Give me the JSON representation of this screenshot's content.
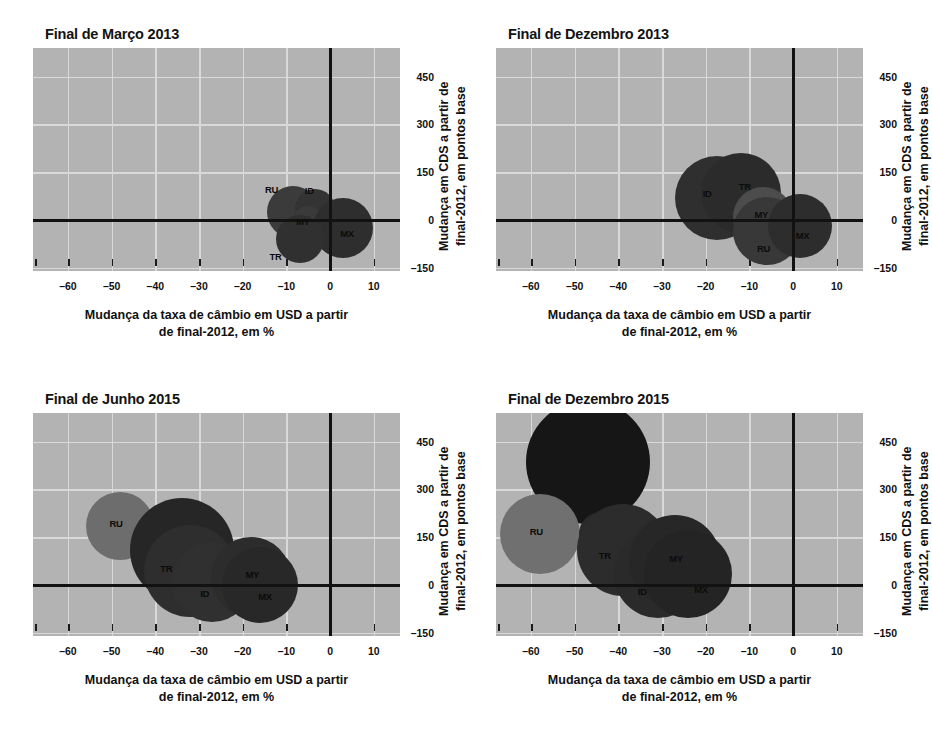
{
  "figure": {
    "panel_count": 4,
    "background_color": "#ffffff",
    "plot_background_color": "#b3b3b3",
    "gridline_color": "#d9d9d9",
    "axis_color": "#121212"
  },
  "axis": {
    "xlabel_line1": "Mudança da taxa de câmbio em USD a partir",
    "xlabel_line2": "de final-2012, em %",
    "ylabel_line1": "Mudança em CDS a partir de",
    "ylabel_line2": "final-2012, em pontos base",
    "xticks": [
      "–60",
      "–50",
      "–40",
      "–30",
      "–20",
      "–10",
      "0",
      "10"
    ],
    "xtick_values": [
      -60,
      -50,
      -40,
      -30,
      -20,
      -10,
      0,
      10
    ],
    "yticks": [
      "450",
      "300",
      "150",
      "0",
      "–150"
    ],
    "ytick_values": [
      450,
      300,
      150,
      0,
      -150
    ],
    "xlim": [
      -68,
      16
    ],
    "ylim": [
      -160,
      540
    ]
  },
  "chart_data": [
    {
      "type": "scatter",
      "title": "Final de Março 2013",
      "xlabel": "Mudança da taxa de câmbio em USD a partir de final-2012, em %",
      "ylabel": "Mudança em CDS a partir de final-2012, em pontos base",
      "xlim": [
        -68,
        16
      ],
      "ylim": [
        -160,
        540
      ],
      "grid": true,
      "points": [
        {
          "label": "RU",
          "x": -8.5,
          "y": 25,
          "size": 26,
          "color": "#3b3b3b",
          "label_dx": -20,
          "label_dy": -22
        },
        {
          "label": "ID",
          "x": -3.5,
          "y": 35,
          "size": 20,
          "color": "#333333",
          "label_dx": -2,
          "label_dy": -18
        },
        {
          "label": "MY",
          "x": -5.0,
          "y": -5,
          "size": 16,
          "color": "#3a3a3a",
          "label_dx": -4,
          "label_dy": 0
        },
        {
          "label": "MX",
          "x": 3.0,
          "y": -25,
          "size": 30,
          "color": "#2e2e2e",
          "label_dx": 5,
          "label_dy": 6
        },
        {
          "label": "TR",
          "x": -7.0,
          "y": -60,
          "size": 24,
          "color": "#303030",
          "label_dx": -22,
          "label_dy": 18
        }
      ]
    },
    {
      "type": "scatter",
      "title": "Final de Dezembro 2013",
      "xlabel": "Mudança da taxa de câmbio em USD a partir de final-2012, em %",
      "ylabel": "Mudança em CDS a partir de final-2012, em pontos base",
      "xlim": [
        -68,
        16
      ],
      "ylim": [
        -160,
        540
      ],
      "grid": true,
      "points": [
        {
          "label": "ID",
          "x": -17.5,
          "y": 70,
          "size": 42,
          "color": "#2f2f2f",
          "label_dx": -6,
          "label_dy": -4
        },
        {
          "label": "TR",
          "x": -12.0,
          "y": 85,
          "size": 40,
          "color": "#2b2b2b",
          "label_dx": 6,
          "label_dy": -6
        },
        {
          "label": "MY",
          "x": -7.0,
          "y": 10,
          "size": 30,
          "color": "#4c4c4c",
          "label_dx": 0,
          "label_dy": -2
        },
        {
          "label": "RU",
          "x": -6.0,
          "y": -35,
          "size": 34,
          "color": "#383838",
          "label_dx": -2,
          "label_dy": 18
        },
        {
          "label": "MX",
          "x": 1.5,
          "y": -20,
          "size": 32,
          "color": "#2d2d2d",
          "label_dx": 4,
          "label_dy": 10
        }
      ]
    },
    {
      "type": "scatter",
      "title": "Final de Junho 2015",
      "xlabel": "Mudança da taxa de câmbio em USD a partir de final-2012, em %",
      "ylabel": "Mudança em CDS a partir de final-2012, em pontos base",
      "xlim": [
        -68,
        16
      ],
      "ylim": [
        -160,
        540
      ],
      "grid": true,
      "points": [
        {
          "label": "RU",
          "x": -48.0,
          "y": 185,
          "size": 34,
          "color": "#6d6d6d",
          "label_dx": -3,
          "label_dy": -2
        },
        {
          "label": "",
          "x": -34.0,
          "y": 110,
          "size": 52,
          "color": "#262626",
          "label_dx": 0,
          "label_dy": 0
        },
        {
          "label": "TR",
          "x": -32.0,
          "y": 45,
          "size": 46,
          "color": "#2e2e2e",
          "label_dx": -22,
          "label_dy": -2
        },
        {
          "label": "ID",
          "x": -27.0,
          "y": 10,
          "size": 40,
          "color": "#303030",
          "label_dx": -4,
          "label_dy": 12
        },
        {
          "label": "MY",
          "x": -18.0,
          "y": 25,
          "size": 40,
          "color": "#2c2c2c",
          "label_dx": 2,
          "label_dy": -2
        },
        {
          "label": "MX",
          "x": -16.0,
          "y": 0,
          "size": 38,
          "color": "#282828",
          "label_dx": 6,
          "label_dy": 12
        }
      ]
    },
    {
      "type": "scatter",
      "title": "Final de Dezembro 2015",
      "xlabel": "Mudança da taxa de câmbio em USD a partir de final-2012, em %",
      "ylabel": "Mudança em CDS a partir de final-2012, em pontos base",
      "xlim": [
        -68,
        16
      ],
      "ylim": [
        -160,
        540
      ],
      "grid": true,
      "points": [
        {
          "label": "",
          "x": -47.0,
          "y": 385,
          "size": 62,
          "color": "#161616",
          "label_dx": 0,
          "label_dy": 0
        },
        {
          "label": "RU",
          "x": -58.0,
          "y": 160,
          "size": 40,
          "color": "#707070",
          "label_dx": -2,
          "label_dy": -2
        },
        {
          "label": "",
          "x": -44.0,
          "y": 160,
          "size": 22,
          "color": "#2a2a2a",
          "label_dx": 0,
          "label_dy": 0
        },
        {
          "label": "TR",
          "x": -39.0,
          "y": 110,
          "size": 46,
          "color": "#2c2c2c",
          "label_dx": -16,
          "label_dy": 6
        },
        {
          "label": "ID",
          "x": -31.0,
          "y": 35,
          "size": 44,
          "color": "#2a2a2a",
          "label_dx": -12,
          "label_dy": 18
        },
        {
          "label": "MY",
          "x": -27.0,
          "y": 75,
          "size": 46,
          "color": "#272727",
          "label_dx": 2,
          "label_dy": -2
        },
        {
          "label": "MX",
          "x": -24.0,
          "y": 35,
          "size": 44,
          "color": "#242424",
          "label_dx": 14,
          "label_dy": 16
        }
      ]
    }
  ]
}
